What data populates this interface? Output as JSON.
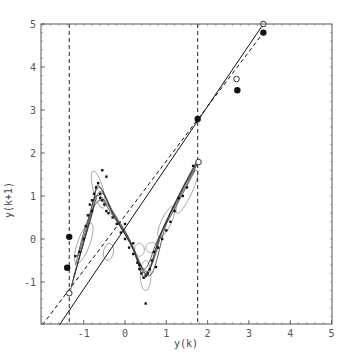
{
  "chart_data": {
    "type": "scatter",
    "title": "",
    "xlabel": "y(k)",
    "ylabel": "y(k+1)",
    "xlim": [
      -2.07,
      5
    ],
    "ylim": [
      -1.98,
      5
    ],
    "xticks": [
      -1,
      0,
      1,
      2,
      3,
      4,
      5
    ],
    "yticks": [
      -1,
      0,
      1,
      2,
      3,
      4,
      5
    ],
    "grid": false,
    "legend": null,
    "vertical_dashed_lines": [
      -1.35,
      1.76
    ],
    "series": [
      {
        "name": "solid-fit-line",
        "style": "solid",
        "x": [
          -1.59,
          3.35
        ],
        "y": [
          -2.0,
          5.0
        ]
      },
      {
        "name": "dashed-fit-line",
        "style": "dashed",
        "x": [
          -2.0,
          3.35
        ],
        "y": [
          -2.0,
          4.8
        ]
      },
      {
        "name": "open-circles",
        "marker": "open-circle",
        "x": [
          -1.35,
          1.78,
          2.7,
          3.35
        ],
        "y": [
          -1.26,
          1.79,
          3.72,
          5.0
        ]
      },
      {
        "name": "filled-dots",
        "marker": "large-filled-circle",
        "x": [
          -1.35,
          -1.4,
          1.76,
          2.72,
          3.35
        ],
        "y": [
          0.05,
          -0.67,
          2.79,
          3.46,
          4.8
        ]
      },
      {
        "name": "data-scatter",
        "marker": "small-square",
        "x": [
          -1.1,
          -1.0,
          -0.95,
          -0.9,
          -0.85,
          -0.8,
          -0.75,
          -0.7,
          -0.65,
          -0.6,
          -0.55,
          -0.5,
          -0.45,
          -0.4,
          -0.3,
          -0.2,
          -0.1,
          0.0,
          0.1,
          0.2,
          0.3,
          0.35,
          0.4,
          0.45,
          0.5,
          0.55,
          0.6,
          0.65,
          0.7,
          0.8,
          0.9,
          1.0,
          1.1,
          1.2,
          1.3,
          1.5,
          -0.55,
          -0.45,
          0.5,
          -1.2,
          0.2,
          1.65,
          -0.8,
          -0.6,
          0.0,
          0.35,
          0.75,
          1.4
        ],
        "y": [
          -0.3,
          0.0,
          0.3,
          0.55,
          0.8,
          0.9,
          1.05,
          1.2,
          1.3,
          1.05,
          0.9,
          0.8,
          0.65,
          0.6,
          0.5,
          0.35,
          0.15,
          0.0,
          -0.2,
          -0.35,
          -0.55,
          -0.7,
          -0.8,
          -0.9,
          -0.85,
          -0.8,
          -0.7,
          -0.5,
          -0.3,
          -0.2,
          0.0,
          0.2,
          0.4,
          0.65,
          0.95,
          1.2,
          1.6,
          1.45,
          -1.5,
          -0.4,
          -0.1,
          1.7,
          0.65,
          0.95,
          0.35,
          -0.6,
          -0.65,
          1.0
        ]
      }
    ],
    "trajectory_curves": [
      {
        "x": [
          -1.35,
          -0.9,
          -0.65,
          -0.3,
          0.1,
          0.5,
          0.9,
          1.3,
          1.76
        ],
        "y": [
          -1.3,
          0.3,
          1.2,
          0.6,
          0.0,
          -0.8,
          0.2,
          1.0,
          1.8
        ]
      },
      {
        "x": [
          -1.3,
          -0.85,
          -0.6,
          -0.25,
          0.15,
          0.55,
          0.95,
          1.35,
          1.76
        ],
        "y": [
          -1.1,
          0.4,
          1.1,
          0.5,
          -0.1,
          -0.75,
          0.3,
          1.1,
          1.8
        ]
      },
      {
        "x": [
          -1.25,
          -0.8,
          -0.65,
          -0.2,
          0.2,
          0.5,
          0.85,
          1.25,
          1.76
        ],
        "y": [
          -0.9,
          0.6,
          1.25,
          0.45,
          -0.25,
          -0.9,
          0.1,
          0.85,
          1.75
        ]
      },
      {
        "x": [
          -1.2,
          -0.95,
          -0.7,
          -0.35,
          0.05,
          0.45,
          0.8,
          1.2,
          1.7
        ],
        "y": [
          -0.6,
          0.2,
          1.0,
          0.7,
          0.1,
          -0.7,
          0.0,
          0.7,
          1.6
        ]
      },
      {
        "x": [
          -1.15,
          -0.9,
          -0.6,
          -0.3,
          0.1,
          0.6,
          1.0,
          1.4,
          1.76
        ],
        "y": [
          -0.4,
          0.45,
          0.9,
          0.55,
          -0.05,
          -0.85,
          0.35,
          1.2,
          1.85
        ]
      }
    ],
    "ellipses": [
      {
        "cx": -0.65,
        "cy": 1.15,
        "rx": 0.12,
        "ry": 0.45,
        "rot": -15
      },
      {
        "cx": 0.5,
        "cy": -0.85,
        "rx": 0.13,
        "ry": 0.35,
        "rot": 0
      },
      {
        "cx": 1.5,
        "cy": 1.1,
        "rx": 0.12,
        "ry": 0.55,
        "rot": 25
      },
      {
        "cx": -1.0,
        "cy": -0.1,
        "rx": 0.15,
        "ry": 0.5,
        "rot": 20
      },
      {
        "cx": 0.65,
        "cy": -0.2,
        "rx": 0.15,
        "ry": 0.12,
        "rot": 0
      },
      {
        "cx": 0.35,
        "cy": -0.25,
        "rx": 0.12,
        "ry": 0.15,
        "rot": 0
      },
      {
        "cx": -0.4,
        "cy": -0.3,
        "rx": 0.12,
        "ry": 0.2,
        "rot": 10
      },
      {
        "cx": 1.0,
        "cy": 0.4,
        "rx": 0.12,
        "ry": 0.4,
        "rot": 25
      }
    ]
  }
}
